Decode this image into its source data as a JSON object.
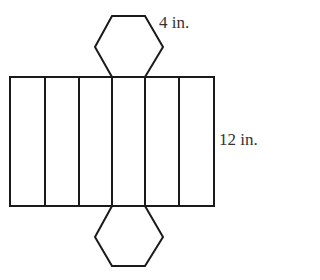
{
  "diagram": {
    "labels": {
      "hex_side": "4 in.",
      "height": "12 in."
    },
    "colors": {
      "stroke": "#1a1a1a",
      "background": "#ffffff",
      "text": "#333333"
    },
    "rectangle": {
      "x": 10,
      "y": 77,
      "width": 204,
      "height": 129,
      "faces": 6
    },
    "dividers_x": [
      45,
      79,
      112,
      145,
      179
    ],
    "top_hexagon_points": "112,16 145,16 163,47 145,77 112,77 95,47",
    "bottom_hexagon_points": "112,206 145,206 163,237 145,266 112,266 95,237"
  }
}
